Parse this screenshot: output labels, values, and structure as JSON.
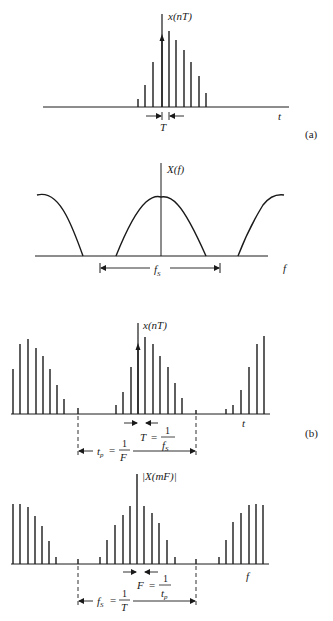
{
  "figure": {
    "panel_a": {
      "label": "(a)",
      "time_plot": {
        "ylabel": "x(nT)",
        "xlabel": "t",
        "spacing_label": "T",
        "baseline_y": 107,
        "axis_x": 162,
        "axis_top": 14,
        "samples": [
          {
            "x": 138,
            "top": 99
          },
          {
            "x": 145,
            "top": 85
          },
          {
            "x": 153,
            "top": 62
          },
          {
            "x": 162,
            "top": 38
          },
          {
            "x": 169,
            "top": 31
          },
          {
            "x": 176,
            "top": 40
          },
          {
            "x": 184,
            "top": 50
          },
          {
            "x": 191,
            "top": 62
          },
          {
            "x": 199,
            "top": 76
          },
          {
            "x": 206,
            "top": 93
          }
        ]
      },
      "freq_plot": {
        "ylabel": "X(f)",
        "xlabel": "f",
        "span_label": "f_S",
        "baseline_y": 256,
        "axis_x": 161
      }
    },
    "panel_b": {
      "label": "(b)",
      "time_plot": {
        "ylabel": "x(nT)",
        "xlabel": "t",
        "spacing_label_T": "T",
        "spacing_eq": "=",
        "spacing_num": "1",
        "spacing_den": "f_S",
        "period_label": "t_p",
        "period_num": "1",
        "period_den": "F",
        "baseline_y": 414,
        "samples": [
          {
            "x": 13,
            "top": 369
          },
          {
            "x": 20,
            "top": 344
          },
          {
            "x": 28,
            "top": 339
          },
          {
            "x": 36,
            "top": 348
          },
          {
            "x": 43,
            "top": 356
          },
          {
            "x": 50,
            "top": 369
          },
          {
            "x": 57,
            "top": 385
          },
          {
            "x": 64,
            "top": 399
          },
          {
            "x": 78,
            "top": 408
          },
          {
            "x": 116,
            "top": 405
          },
          {
            "x": 123,
            "top": 392
          },
          {
            "x": 131,
            "top": 367
          },
          {
            "x": 138,
            "top": 348
          },
          {
            "x": 145,
            "top": 337
          },
          {
            "x": 153,
            "top": 344
          },
          {
            "x": 160,
            "top": 356
          },
          {
            "x": 168,
            "top": 367
          },
          {
            "x": 175,
            "top": 383
          },
          {
            "x": 182,
            "top": 398
          },
          {
            "x": 196,
            "top": 410
          },
          {
            "x": 226,
            "top": 409
          },
          {
            "x": 233,
            "top": 405
          },
          {
            "x": 241,
            "top": 390
          },
          {
            "x": 249,
            "top": 367
          },
          {
            "x": 257,
            "top": 344
          },
          {
            "x": 264,
            "top": 336
          }
        ]
      },
      "freq_plot": {
        "ylabel": "|X(mF)|",
        "xlabel": "f",
        "spacing_label_F": "F",
        "spacing_eq": "=",
        "spacing_num": "1",
        "spacing_den": "t_p",
        "span_label": "f_S",
        "span_num": "1",
        "span_den": "T",
        "baseline_y": 564,
        "samples": [
          {
            "x": 13,
            "top": 504
          },
          {
            "x": 20,
            "top": 504
          },
          {
            "x": 28,
            "top": 507
          },
          {
            "x": 35,
            "top": 516
          },
          {
            "x": 42,
            "top": 526
          },
          {
            "x": 49,
            "top": 541
          },
          {
            "x": 56,
            "top": 557
          },
          {
            "x": 78,
            "top": 559
          },
          {
            "x": 100,
            "top": 557
          },
          {
            "x": 107,
            "top": 540
          },
          {
            "x": 115,
            "top": 525
          },
          {
            "x": 123,
            "top": 515
          },
          {
            "x": 130,
            "top": 506
          },
          {
            "x": 137,
            "top": 474
          },
          {
            "x": 144,
            "top": 506
          },
          {
            "x": 152,
            "top": 513
          },
          {
            "x": 159,
            "top": 523
          },
          {
            "x": 167,
            "top": 540
          },
          {
            "x": 175,
            "top": 557
          },
          {
            "x": 196,
            "top": 559
          },
          {
            "x": 219,
            "top": 557
          },
          {
            "x": 226,
            "top": 540
          },
          {
            "x": 233,
            "top": 522
          },
          {
            "x": 241,
            "top": 513
          },
          {
            "x": 249,
            "top": 505
          },
          {
            "x": 256,
            "top": 504
          },
          {
            "x": 263,
            "top": 505
          }
        ]
      }
    }
  }
}
